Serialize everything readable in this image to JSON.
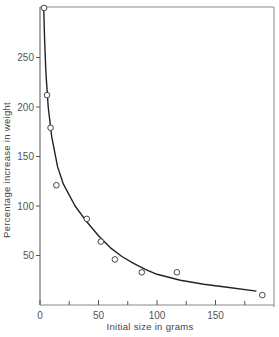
{
  "chart_data": {
    "type": "scatter",
    "title": "",
    "xlabel": "Initial size in grams",
    "ylabel": "Percentage increase in weight",
    "xlim": [
      0,
      200
    ],
    "ylim": [
      0,
      300
    ],
    "grid": false,
    "legend": null,
    "x_ticks": [
      0,
      50,
      100,
      150
    ],
    "x_minor_ticks": [
      25,
      75,
      125,
      175
    ],
    "y_ticks": [
      50,
      100,
      150,
      200,
      250
    ],
    "series": [
      {
        "name": "observations",
        "marker": "open-circle",
        "points": [
          {
            "x": 3.5,
            "y": 300
          },
          {
            "x": 6,
            "y": 212
          },
          {
            "x": 9,
            "y": 179
          },
          {
            "x": 14,
            "y": 121
          },
          {
            "x": 40,
            "y": 87
          },
          {
            "x": 52,
            "y": 64
          },
          {
            "x": 64,
            "y": 46
          },
          {
            "x": 87,
            "y": 33
          },
          {
            "x": 117,
            "y": 33
          },
          {
            "x": 190,
            "y": 10
          }
        ]
      },
      {
        "name": "fitted curve",
        "marker": "line",
        "points": [
          {
            "x": 3.2,
            "y": 300
          },
          {
            "x": 4,
            "y": 265
          },
          {
            "x": 5,
            "y": 235
          },
          {
            "x": 7,
            "y": 200
          },
          {
            "x": 10,
            "y": 170
          },
          {
            "x": 15,
            "y": 140
          },
          {
            "x": 20,
            "y": 122
          },
          {
            "x": 30,
            "y": 100
          },
          {
            "x": 40,
            "y": 84
          },
          {
            "x": 50,
            "y": 70
          },
          {
            "x": 60,
            "y": 58
          },
          {
            "x": 70,
            "y": 49
          },
          {
            "x": 80,
            "y": 42
          },
          {
            "x": 90,
            "y": 36
          },
          {
            "x": 100,
            "y": 31
          },
          {
            "x": 120,
            "y": 25
          },
          {
            "x": 140,
            "y": 21
          },
          {
            "x": 160,
            "y": 18
          },
          {
            "x": 185,
            "y": 14
          }
        ]
      }
    ]
  },
  "labels": {
    "xlabel": "Initial size in grams",
    "ylabel": "Percentage increase in weight",
    "x_ticks": [
      "0",
      "50",
      "100",
      "150"
    ],
    "y_ticks": [
      "50",
      "100",
      "150",
      "200",
      "250"
    ]
  }
}
